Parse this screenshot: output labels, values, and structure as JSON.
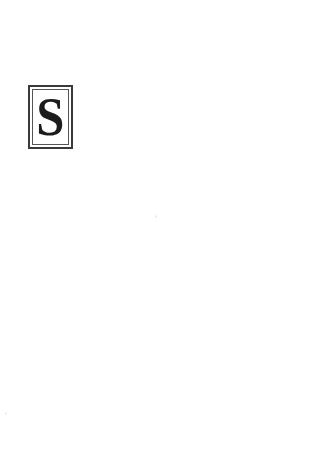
{
  "page": {
    "kind": "scanned-book-page",
    "background_color": "#ffffff",
    "width": 310,
    "height": 471,
    "body_text": ""
  },
  "dropcap": {
    "letter": "S",
    "letter_color": "#1c1c1c",
    "outer_rule_color": "#3a3a3a",
    "inner_rule_color": "#555555",
    "field_color": "#ffffff",
    "position": {
      "left": 28,
      "top": 85,
      "width": 45,
      "height": 64
    }
  },
  "artifacts": {
    "color": "#d8d8d8",
    "specks": [
      {
        "name": "speck-center",
        "left": 155,
        "top": 215
      },
      {
        "name": "speck-bottom-left",
        "left": 5,
        "top": 412
      }
    ]
  }
}
